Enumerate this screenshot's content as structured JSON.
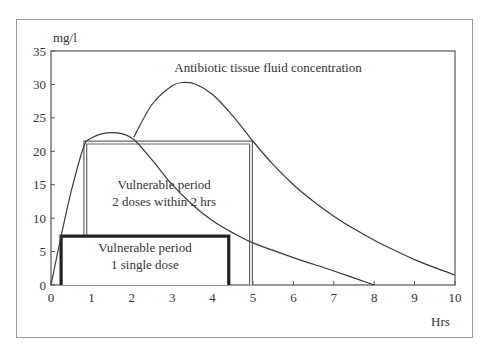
{
  "chart_data": {
    "type": "line",
    "title": "",
    "xlabel": "Hrs",
    "ylabel": "mg/l",
    "xlim": [
      0,
      10
    ],
    "ylim": [
      0,
      35
    ],
    "x_ticks": [
      "0",
      "1",
      "2",
      "3",
      "4",
      "5",
      "6",
      "7",
      "8",
      "9",
      "10"
    ],
    "y_ticks": [
      "0",
      "5",
      "10",
      "15",
      "20",
      "25",
      "30",
      "35"
    ],
    "grid": false,
    "series": [
      {
        "name": "Single dose concentration",
        "points": [
          [
            0,
            0
          ],
          [
            0.25,
            7.3
          ],
          [
            0.5,
            14
          ],
          [
            0.8,
            20.5
          ],
          [
            1.0,
            22
          ],
          [
            1.5,
            22.8
          ],
          [
            2.0,
            22
          ],
          [
            2.5,
            18.7
          ],
          [
            3.0,
            15
          ],
          [
            3.5,
            12
          ],
          [
            4.0,
            9.6
          ],
          [
            4.5,
            7.8
          ],
          [
            5.0,
            6.3
          ],
          [
            6.0,
            4.1
          ],
          [
            7.0,
            2.1
          ],
          [
            8.0,
            0
          ]
        ]
      },
      {
        "name": "Second dose concentration",
        "points": [
          [
            2.05,
            22.1
          ],
          [
            2.5,
            27
          ],
          [
            3.0,
            29.8
          ],
          [
            3.3,
            30.3
          ],
          [
            3.6,
            30
          ],
          [
            4.0,
            28.5
          ],
          [
            4.5,
            25.3
          ],
          [
            5.0,
            21.5
          ],
          [
            5.5,
            18
          ],
          [
            6.0,
            15
          ],
          [
            6.5,
            12.5
          ],
          [
            7.0,
            10.3
          ],
          [
            7.5,
            8.4
          ],
          [
            8.0,
            6.7
          ],
          [
            8.5,
            5.2
          ],
          [
            9.0,
            3.8
          ],
          [
            9.5,
            2.6
          ],
          [
            10.0,
            1.5
          ]
        ]
      }
    ],
    "regions": [
      {
        "name": "Vulnerable period 2 doses within 2 hrs",
        "style": "double-line",
        "x": [
          0.85,
          4.95
        ],
        "y": [
          0,
          21.3
        ],
        "label_lines": [
          "Vulnerable    period",
          "2 doses within    2 hrs"
        ]
      },
      {
        "name": "Vulnerable period 1 single dose",
        "style": "bold",
        "x": [
          0.25,
          4.4
        ],
        "y": [
          0,
          7.3
        ],
        "label_lines": [
          "Vulnerable period",
          "1 single dose"
        ]
      }
    ],
    "annotations": [
      {
        "text": "Antibiotic tissue fluid concentration",
        "x": 5.0,
        "y": 32.5
      }
    ]
  }
}
